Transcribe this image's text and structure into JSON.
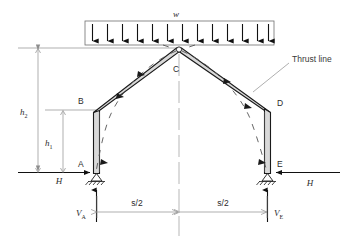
{
  "figure": {
    "type": "structural-diagram",
    "background_color": "#ffffff",
    "line_color": "#1a1a1a",
    "member_fill": "#d9d9d9",
    "dim_color": "#8d8d8d"
  },
  "labels": {
    "load": "w",
    "thrust_line": "Thrust line",
    "node_a": "A",
    "node_b": "B",
    "node_c": "C",
    "node_d": "D",
    "node_e": "E",
    "height_outer": "h",
    "height_outer_sub": "2",
    "height_inner": "h",
    "height_inner_sub": "1",
    "horiz_left": "H",
    "horiz_right": "H",
    "vert_left": "V",
    "vert_left_sub": "A",
    "vert_right": "V",
    "vert_right_sub": "E",
    "span_left": "s/2",
    "span_right": "s/2"
  },
  "load": {
    "arrow_count": 13,
    "box_left": 85,
    "box_right": 274,
    "box_top": 21,
    "box_bottom": 45,
    "direction": "downward"
  },
  "geometry": {
    "base_y": 173,
    "apex_x": 179,
    "apex_y": 49,
    "left_base_x": 96,
    "right_base_x": 268,
    "left_knee_x": 96,
    "left_knee_y": 110,
    "right_knee_x": 268,
    "right_knee_y": 110,
    "h2_top_y": 48,
    "h1_top_y": 110
  },
  "supports": {
    "left_type": "pinned",
    "right_type": "pinned",
    "hatch_count": 5
  },
  "apex": {
    "joint_type": "hinge",
    "marker": "open-circle"
  }
}
